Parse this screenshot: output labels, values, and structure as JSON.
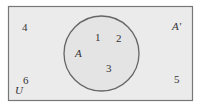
{
  "diagram": {
    "type": "venn",
    "universal_set": {
      "label": "U",
      "fill": "#ebebeb",
      "stroke": "#777777"
    },
    "set_a": {
      "label": "A",
      "complement_label": "A'",
      "fill": "#e4e4e4",
      "stroke": "#666666"
    },
    "elements_in_a": [
      "1",
      "2",
      "3"
    ],
    "elements_outside_a": [
      "4",
      "5",
      "6"
    ]
  },
  "labels": {
    "e1": "1",
    "e2": "2",
    "e3": "3",
    "e4": "4",
    "e5": "5",
    "e6": "6",
    "A": "A",
    "Acomp": "A'",
    "U": "U"
  }
}
